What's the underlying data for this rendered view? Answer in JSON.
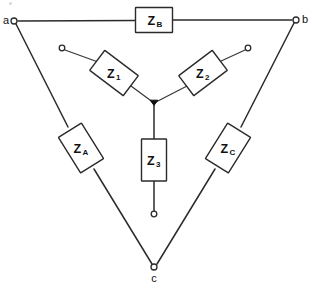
{
  "diagram": {
    "type": "circuit-schematic",
    "canvas": {
      "width": 312,
      "height": 288
    },
    "colors": {
      "background": "#ffffff",
      "wire": "#2b2b2b",
      "box_fill": "#ffffff",
      "box_stroke": "#2b2b2b",
      "text": "#111111",
      "junction": "#111111"
    },
    "nodes": [
      {
        "id": "a",
        "label": "a",
        "x": 14,
        "y": 21,
        "label_x": 6,
        "label_y": 24,
        "kind": "terminal-open"
      },
      {
        "id": "b",
        "label": "b",
        "x": 296,
        "y": 20,
        "label_x": 305,
        "label_y": 23,
        "kind": "terminal-open"
      },
      {
        "id": "c",
        "label": "c",
        "x": 154,
        "y": 267,
        "label_x": 154,
        "label_y": 281,
        "kind": "terminal-open"
      }
    ],
    "center_junction": {
      "x": 154,
      "y": 103,
      "kind": "solid-dot"
    },
    "open_terminals": [
      {
        "id": "t1",
        "x": 62,
        "y": 48,
        "belongs_to": "Z1"
      },
      {
        "id": "t2",
        "x": 248,
        "y": 48,
        "belongs_to": "Z2"
      },
      {
        "id": "t3",
        "x": 154,
        "y": 214,
        "belongs_to": "Z3"
      }
    ],
    "components": [
      {
        "id": "ZB",
        "label": "Z",
        "subscript": "B",
        "cx": 154,
        "cy": 20,
        "w": 37,
        "h": 25,
        "rotation": 0,
        "network": "delta",
        "between": "a-b"
      },
      {
        "id": "ZA",
        "label": "Z",
        "subscript": "A",
        "cx": 81,
        "cy": 148,
        "w": 42,
        "h": 27,
        "rotation": 58,
        "network": "delta",
        "between": "a-c"
      },
      {
        "id": "ZC",
        "label": "Z",
        "subscript": "C",
        "cx": 228,
        "cy": 148,
        "w": 42,
        "h": 27,
        "rotation": -58,
        "network": "delta",
        "between": "b-c"
      },
      {
        "id": "Z1",
        "label": "Z",
        "subscript": "1",
        "cx": 114,
        "cy": 73,
        "w": 42,
        "h": 25,
        "rotation": 37,
        "network": "wye",
        "between": "t1-center"
      },
      {
        "id": "Z2",
        "label": "Z",
        "subscript": "2",
        "cx": 203,
        "cy": 73,
        "w": 42,
        "h": 25,
        "rotation": -37,
        "network": "wye",
        "between": "t2-center"
      },
      {
        "id": "Z3",
        "label": "Z",
        "subscript": "3",
        "cx": 154,
        "cy": 160,
        "w": 25,
        "h": 42,
        "rotation": 0,
        "network": "wye",
        "between": "center-t3"
      }
    ]
  }
}
